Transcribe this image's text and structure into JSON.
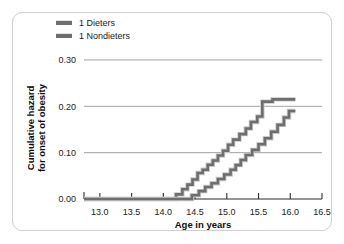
{
  "chart_data": {
    "type": "line",
    "subtype": "step",
    "title": "",
    "xlabel": "Age in years",
    "ylabel": "Cumulative hazard for onset of obesity",
    "ylabel_lines": [
      "Cumulative hazard",
      "for onset of obesity"
    ],
    "xlim": [
      12.75,
      16.5
    ],
    "ylim": [
      0.0,
      0.315
    ],
    "xticks": [
      13.0,
      13.5,
      14.0,
      14.5,
      15.0,
      15.5,
      16.0,
      16.5
    ],
    "xticklabels": [
      "13.0",
      "13.5",
      "14.0",
      "14.5",
      "15.0",
      "15.5",
      "16.0",
      "16.5"
    ],
    "yticks": [
      0.0,
      0.1,
      0.2,
      0.3
    ],
    "yticklabels": [
      "0.00",
      "0.10",
      "0.20",
      "0.30"
    ],
    "grid": "horizontal",
    "legend_position": "top-left",
    "series": [
      {
        "name": "1 Dieters",
        "color": "#6e6e6e",
        "points": [
          [
            12.75,
            0.0
          ],
          [
            14.2,
            0.0
          ],
          [
            14.2,
            0.01
          ],
          [
            14.3,
            0.01
          ],
          [
            14.3,
            0.021
          ],
          [
            14.38,
            0.021
          ],
          [
            14.38,
            0.031
          ],
          [
            14.46,
            0.031
          ],
          [
            14.46,
            0.042
          ],
          [
            14.54,
            0.042
          ],
          [
            14.54,
            0.056
          ],
          [
            14.62,
            0.056
          ],
          [
            14.62,
            0.063
          ],
          [
            14.7,
            0.063
          ],
          [
            14.7,
            0.074
          ],
          [
            14.78,
            0.074
          ],
          [
            14.78,
            0.083
          ],
          [
            14.86,
            0.083
          ],
          [
            14.86,
            0.094
          ],
          [
            14.94,
            0.094
          ],
          [
            14.94,
            0.104
          ],
          [
            15.02,
            0.104
          ],
          [
            15.02,
            0.117
          ],
          [
            15.1,
            0.117
          ],
          [
            15.1,
            0.128
          ],
          [
            15.2,
            0.128
          ],
          [
            15.2,
            0.14
          ],
          [
            15.3,
            0.14
          ],
          [
            15.3,
            0.152
          ],
          [
            15.38,
            0.152
          ],
          [
            15.38,
            0.166
          ],
          [
            15.48,
            0.166
          ],
          [
            15.48,
            0.178
          ],
          [
            15.56,
            0.178
          ],
          [
            15.56,
            0.21
          ],
          [
            15.72,
            0.21
          ],
          [
            15.72,
            0.215
          ],
          [
            16.08,
            0.215
          ]
        ]
      },
      {
        "name": "1 Nondieters",
        "color": "#6e6e6e",
        "points": [
          [
            12.75,
            0.0
          ],
          [
            14.45,
            0.0
          ],
          [
            14.45,
            0.008
          ],
          [
            14.56,
            0.008
          ],
          [
            14.56,
            0.017
          ],
          [
            14.66,
            0.017
          ],
          [
            14.66,
            0.026
          ],
          [
            14.76,
            0.026
          ],
          [
            14.76,
            0.034
          ],
          [
            14.86,
            0.034
          ],
          [
            14.86,
            0.043
          ],
          [
            14.96,
            0.043
          ],
          [
            14.96,
            0.053
          ],
          [
            15.06,
            0.053
          ],
          [
            15.06,
            0.063
          ],
          [
            15.14,
            0.063
          ],
          [
            15.14,
            0.073
          ],
          [
            15.22,
            0.073
          ],
          [
            15.22,
            0.084
          ],
          [
            15.3,
            0.084
          ],
          [
            15.3,
            0.095
          ],
          [
            15.4,
            0.095
          ],
          [
            15.4,
            0.106
          ],
          [
            15.5,
            0.106
          ],
          [
            15.5,
            0.118
          ],
          [
            15.6,
            0.118
          ],
          [
            15.6,
            0.131
          ],
          [
            15.7,
            0.131
          ],
          [
            15.7,
            0.145
          ],
          [
            15.8,
            0.145
          ],
          [
            15.8,
            0.16
          ],
          [
            15.9,
            0.16
          ],
          [
            15.9,
            0.176
          ],
          [
            15.98,
            0.176
          ],
          [
            15.98,
            0.19
          ],
          [
            16.08,
            0.19
          ]
        ]
      }
    ]
  },
  "legend": {
    "items": [
      {
        "label": "1 Dieters",
        "swatch_color": "#6e6e6e"
      },
      {
        "label": "1 Nondieters",
        "swatch_color": "#6e6e6e"
      }
    ]
  },
  "axes": {
    "x_title": "Age in years",
    "y_title_line1": "Cumulative hazard",
    "y_title_line2": "for onset of obesity"
  },
  "colors": {
    "frame_border": "#cfcfcf",
    "background": "#ffffff",
    "grid": "#8a8a8a",
    "axis": "#2b2b2b",
    "text": "#1a1a1a",
    "series": "#6e6e6e"
  }
}
